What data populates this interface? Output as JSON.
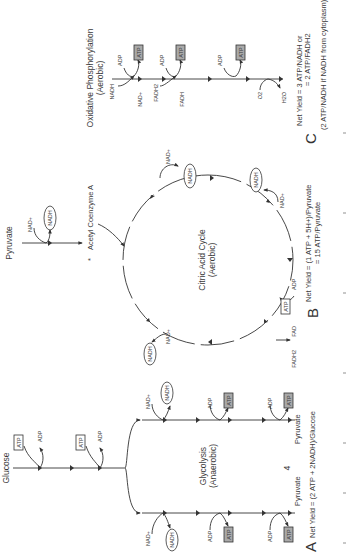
{
  "glycolysis": {
    "start_label": "Glucose",
    "title": "Glycolysis",
    "subtitle": "(Anaerobic)",
    "invest": [
      {
        "in": "ATP",
        "out": "ADP"
      },
      {
        "in": "ATP",
        "out": "ADP"
      }
    ],
    "branch_left": {
      "nad_in": "NAD+",
      "nad_out": "NADH",
      "steps": [
        {
          "in": "ADP",
          "out": "ATP"
        },
        {
          "in": "ADP",
          "out": "ATP"
        }
      ],
      "end_label": "Pyruvate"
    },
    "branch_right": {
      "nad_in": "NAD+",
      "nad_out": "NADH",
      "steps": [
        {
          "in": "ADP",
          "out": "ATP"
        },
        {
          "in": "ADP",
          "out": "ATP"
        }
      ],
      "end_label": "Pyruvate"
    },
    "marker": "4",
    "panel_letter": "A",
    "net_yield": "Net Yield = (2 ATP + 2NADH)/Glucose"
  },
  "citric_acid_cycle": {
    "entry_label": "Pyruvate",
    "entry_nad_in": "NAD+",
    "entry_nad_out": "NADH",
    "acetyl_label": "Acetyl Coenzyme A",
    "acetyl_marker": "*",
    "title": "Citric Acid Cycle",
    "subtitle": "(Aerobic)",
    "nad_steps": [
      {
        "in": "NAD+",
        "out": "NADH"
      },
      {
        "in": "NAD+",
        "out": "NADH"
      },
      {
        "in": "NAD+",
        "out": "NADH"
      }
    ],
    "atp_step": {
      "in": "ADP",
      "out": "ATP"
    },
    "fad_step": {
      "in": "FAD",
      "out": "FADH2"
    },
    "panel_letter": "B",
    "net_yield_line1": "Net Yield = (1 ATP + 5H+)/Pyruvate",
    "net_yield_line2": "= 15 ATP/Pyruvate"
  },
  "oxidative_phosphorylation": {
    "title": "Oxidative Phosphorylation",
    "subtitle": "(Aerobic)",
    "nadh_in": "NADH",
    "nad_out": "NAD+",
    "fadh2_in": "FADH2",
    "fadh_out": "FADH",
    "atp_steps": [
      {
        "in": "ADP",
        "out": "ATP"
      },
      {
        "in": "ADP",
        "out": "ATP"
      },
      {
        "in": "ADP",
        "out": "ATP"
      }
    ],
    "oxygen_in": "O2",
    "water_out": "H2O",
    "panel_letter": "C",
    "net_yield_line1": "Net Yield = 3 ATP/NADH or",
    "net_yield_line2": "= 2 ATP/FADH2",
    "note": "(2 ATP/NADH if NADH from cytoplasm)"
  },
  "colors": {
    "line": "#333333",
    "atp_box_fill": "#a9a9a9",
    "text": "#3a3a3a",
    "background": "#ffffff"
  }
}
